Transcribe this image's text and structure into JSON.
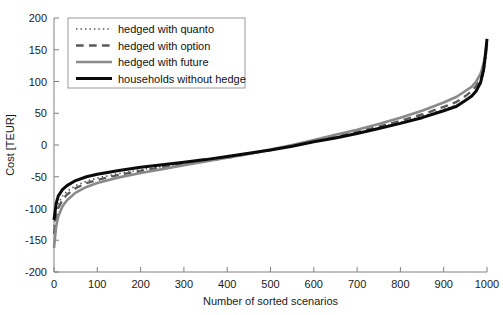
{
  "chart_data": {
    "type": "line",
    "title": "",
    "xlabel": "Number of sorted scenarios",
    "ylabel": "Cost [TEUR]",
    "xlim": [
      0,
      1000
    ],
    "ylim": [
      -200,
      200
    ],
    "xticks": [
      0,
      100,
      200,
      300,
      400,
      500,
      600,
      700,
      800,
      900,
      1000
    ],
    "yticks": [
      -200,
      -150,
      -100,
      -50,
      0,
      50,
      100,
      150,
      200
    ],
    "xticklabels": [
      "0",
      "100",
      "200",
      "300",
      "400",
      "500",
      "600",
      "700",
      "800",
      "900",
      "1000"
    ],
    "yticklabels": [
      "-200",
      "-150",
      "-100",
      "-50",
      "0",
      "50",
      "100",
      "150",
      "200"
    ],
    "grid": false,
    "legend_position": "upper-left",
    "x": [
      0,
      5,
      10,
      20,
      30,
      50,
      75,
      100,
      150,
      200,
      250,
      300,
      350,
      400,
      450,
      500,
      550,
      600,
      650,
      700,
      750,
      800,
      850,
      900,
      930,
      950,
      965,
      975,
      985,
      992,
      996,
      1000
    ],
    "series": [
      {
        "name": "hedged with quanto",
        "style": "dotted",
        "color": "#555555",
        "width": 1.6,
        "values": [
          -128,
          -104,
          -92,
          -80,
          -73,
          -64,
          -57,
          -52,
          -45,
          -39,
          -34,
          -29,
          -24,
          -19,
          -14,
          -8,
          -2,
          5,
          12,
          19,
          27,
          36,
          45,
          56,
          63,
          71,
          78,
          85,
          96,
          112,
          128,
          150
        ]
      },
      {
        "name": "hedged with option",
        "style": "dashed",
        "color": "#5a5a5a",
        "width": 2.4,
        "values": [
          -140,
          -112,
          -99,
          -86,
          -78,
          -68,
          -60,
          -55,
          -47,
          -41,
          -35,
          -30,
          -25,
          -20,
          -14,
          -8,
          -1,
          6,
          13,
          21,
          29,
          38,
          48,
          60,
          68,
          77,
          85,
          93,
          105,
          122,
          138,
          158
        ]
      },
      {
        "name": "hedged with future",
        "style": "solid",
        "color": "#8a8a8a",
        "width": 2.6,
        "values": [
          -162,
          -128,
          -112,
          -96,
          -87,
          -75,
          -66,
          -60,
          -51,
          -44,
          -38,
          -32,
          -26,
          -20,
          -14,
          -7,
          0,
          8,
          16,
          24,
          33,
          43,
          54,
          67,
          76,
          85,
          92,
          100,
          112,
          128,
          142,
          160
        ]
      },
      {
        "name": "households without hedge",
        "style": "solid",
        "color": "#0a0a0a",
        "width": 3.0,
        "values": [
          -118,
          -92,
          -80,
          -70,
          -64,
          -56,
          -50,
          -46,
          -40,
          -35,
          -31,
          -27,
          -23,
          -18,
          -13,
          -8,
          -2,
          5,
          11,
          18,
          26,
          34,
          43,
          54,
          61,
          70,
          77,
          85,
          98,
          118,
          140,
          167
        ]
      }
    ]
  },
  "legend": {
    "entries": [
      {
        "label": "hedged with quanto"
      },
      {
        "label": "hedged with option"
      },
      {
        "label": "hedged with future"
      },
      {
        "label": "households without hedge"
      }
    ]
  }
}
